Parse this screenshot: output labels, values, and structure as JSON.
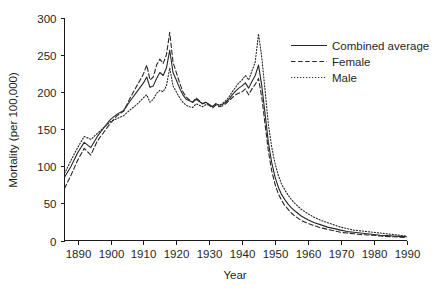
{
  "chart_data": {
    "type": "line",
    "title": "",
    "xlabel": "Year",
    "ylabel": "Mortality (per 100,000)",
    "xlim": [
      1886,
      1990
    ],
    "ylim": [
      0,
      300
    ],
    "xticks": [
      1890,
      1900,
      1910,
      1920,
      1930,
      1940,
      1950,
      1960,
      1970,
      1980,
      1990
    ],
    "xtick_labels": [
      "1890",
      "1900",
      "1910",
      "1920",
      "1930",
      "1940",
      "1950",
      "1960",
      "1970",
      "1980",
      "1990"
    ],
    "yticks": [
      0,
      50,
      100,
      150,
      200,
      250,
      300
    ],
    "ytick_labels": [
      "0",
      "50",
      "100",
      "150",
      "200",
      "250",
      "300"
    ],
    "grid": false,
    "legend_position": "upper right",
    "legend_entries": [
      {
        "label": "Combined average",
        "style": "solid"
      },
      {
        "label": "Female",
        "style": "dashed"
      },
      {
        "label": "Male",
        "style": "dotted"
      }
    ],
    "x": [
      1886,
      1888,
      1890,
      1892,
      1894,
      1896,
      1898,
      1900,
      1902,
      1904,
      1906,
      1908,
      1910,
      1911,
      1912,
      1913,
      1914,
      1915,
      1916,
      1917,
      1918,
      1919,
      1920,
      1921,
      1922,
      1923,
      1924,
      1925,
      1926,
      1927,
      1928,
      1929,
      1930,
      1931,
      1932,
      1933,
      1934,
      1935,
      1936,
      1937,
      1938,
      1939,
      1940,
      1941,
      1942,
      1943,
      1944,
      1945,
      1946,
      1947,
      1948,
      1949,
      1950,
      1951,
      1952,
      1953,
      1954,
      1955,
      1956,
      1958,
      1960,
      1962,
      1964,
      1966,
      1968,
      1970,
      1972,
      1974,
      1976,
      1978,
      1980,
      1982,
      1984,
      1986,
      1988,
      1990
    ],
    "series": [
      {
        "name": "Combined average",
        "style": "solid",
        "values": [
          85,
          100,
          118,
          132,
          125,
          140,
          152,
          163,
          170,
          175,
          188,
          200,
          212,
          220,
          206,
          208,
          218,
          226,
          222,
          232,
          256,
          226,
          216,
          205,
          196,
          190,
          188,
          186,
          190,
          187,
          184,
          186,
          183,
          180,
          184,
          182,
          183,
          186,
          190,
          196,
          201,
          205,
          208,
          212,
          205,
          214,
          222,
          236,
          208,
          170,
          132,
          105,
          86,
          72,
          62,
          55,
          49,
          44,
          40,
          33,
          28,
          24,
          21,
          18,
          16,
          14,
          12,
          11,
          10,
          9,
          8,
          7,
          6.5,
          6,
          5.5,
          5
        ]
      },
      {
        "name": "Female",
        "style": "dashed",
        "values": [
          70,
          88,
          108,
          124,
          115,
          134,
          146,
          158,
          168,
          174,
          192,
          208,
          224,
          236,
          216,
          220,
          236,
          244,
          238,
          250,
          280,
          240,
          226,
          212,
          200,
          193,
          189,
          186,
          192,
          188,
          184,
          186,
          182,
          178,
          182,
          180,
          181,
          184,
          188,
          192,
          196,
          198,
          200,
          204,
          196,
          204,
          210,
          218,
          192,
          156,
          120,
          94,
          76,
          63,
          54,
          47,
          42,
          37,
          33,
          27,
          23,
          20,
          17,
          15,
          13,
          11,
          10,
          9,
          8,
          7.5,
          7,
          6,
          5.5,
          5,
          4.5,
          4
        ]
      },
      {
        "name": "Male",
        "style": "dotted",
        "values": [
          90,
          108,
          125,
          140,
          136,
          144,
          152,
          160,
          164,
          168,
          176,
          183,
          192,
          196,
          186,
          190,
          198,
          202,
          200,
          208,
          232,
          208,
          200,
          192,
          186,
          182,
          180,
          179,
          184,
          182,
          180,
          183,
          182,
          180,
          184,
          182,
          184,
          188,
          193,
          200,
          206,
          212,
          216,
          222,
          216,
          228,
          240,
          278,
          246,
          202,
          156,
          126,
          104,
          88,
          76,
          68,
          61,
          55,
          50,
          42,
          36,
          31,
          27,
          24,
          21,
          18,
          16,
          14,
          13,
          12,
          11,
          10,
          9,
          8,
          7,
          6
        ]
      }
    ]
  }
}
